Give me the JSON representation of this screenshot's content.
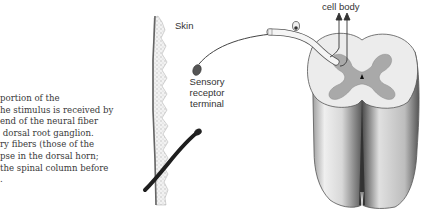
{
  "caption": {
    "lines": [
      "portion of the",
      "he stimulus is received by",
      "end of the neural fiber",
      " dorsal root ganglion.",
      "ry fibers (those of the",
      "pse in the dorsal horn;",
      "the spinal column before",
      "."
    ]
  },
  "figure": {
    "labels": {
      "skin": "Skin",
      "sensory_receptor": [
        "Sensory",
        "receptor",
        "terminal"
      ],
      "cell_body": "cell body"
    },
    "colors": {
      "gray_matter": "#a9a9a9",
      "white_matter": "#e8e8e8",
      "outline": "#555555",
      "dark": "#1e1e1e"
    }
  }
}
